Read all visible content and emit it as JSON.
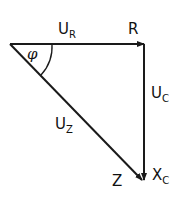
{
  "diagram": {
    "type": "phasor-triangle",
    "stroke_color": "#1a1a1a",
    "vertices": {
      "origin": [
        10,
        44
      ],
      "right": [
        145,
        44
      ],
      "bottom": [
        143,
        181
      ]
    },
    "labels": {
      "ur_main": "U",
      "ur_sub": "R",
      "r": "R",
      "phi": "φ",
      "uc_main": "U",
      "uc_sub": "C",
      "uz_main": "U",
      "uz_sub": "Z",
      "z": "Z",
      "xc_main": "X",
      "xc_sub": "C"
    }
  }
}
